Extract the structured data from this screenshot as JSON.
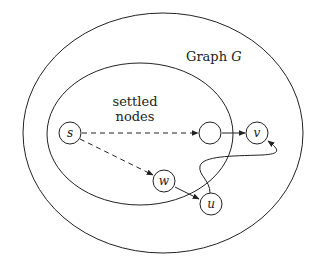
{
  "diagram": {
    "title": "Graph G",
    "title_plain": "Graph ",
    "title_var": "G",
    "region_label_line1": "settled",
    "region_label_line2": "nodes",
    "nodes": [
      {
        "id": "s",
        "label": "s"
      },
      {
        "id": "x",
        "label": ""
      },
      {
        "id": "v",
        "label": "v"
      },
      {
        "id": "w",
        "label": "w"
      },
      {
        "id": "u",
        "label": "u"
      }
    ],
    "edges": [
      {
        "from": "s",
        "to": "x",
        "style": "dashed"
      },
      {
        "from": "s",
        "to": "w",
        "style": "dashed"
      },
      {
        "from": "x",
        "to": "v",
        "style": "solid"
      },
      {
        "from": "w",
        "to": "u",
        "style": "solid"
      },
      {
        "from": "u",
        "to": "v",
        "style": "solid",
        "curved": true
      }
    ],
    "regions": [
      {
        "id": "graph",
        "label": "Graph G"
      },
      {
        "id": "settled",
        "label": "settled nodes"
      }
    ]
  }
}
